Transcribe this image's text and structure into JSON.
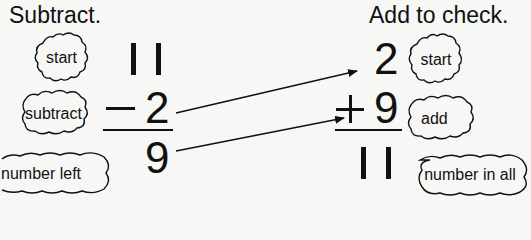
{
  "subtract_side": {
    "heading": "Subtract.",
    "top_number": "11",
    "operator": "−",
    "operand": "2",
    "result": "9",
    "labels": {
      "start": "start",
      "subtract": "subtract",
      "number_left": "number left"
    }
  },
  "add_side": {
    "heading": "Add to check.",
    "top_number": "2",
    "operator": "+",
    "operand": "9",
    "result": "11",
    "labels": {
      "start": "start",
      "add": "add",
      "number_in_all": "number in all"
    }
  },
  "arrows": [
    {
      "from": "subtract_side.operand",
      "to": "add_side.top_number"
    },
    {
      "from": "subtract_side.result",
      "to": "add_side.operand"
    }
  ]
}
